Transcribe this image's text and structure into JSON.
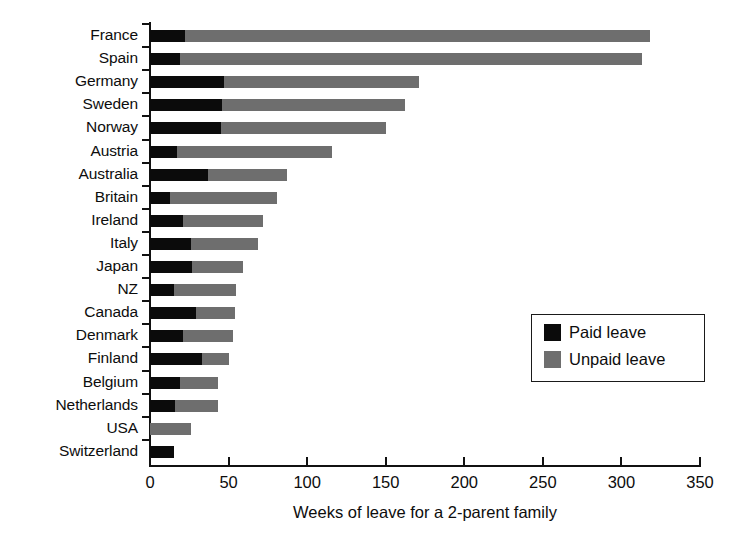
{
  "chart_data": {
    "type": "bar",
    "orientation": "horizontal",
    "stacked": true,
    "title": "",
    "xlabel": "Weeks of leave for a 2-parent family",
    "ylabel": "",
    "xlim": [
      0,
      350
    ],
    "xticks": [
      0,
      50,
      100,
      150,
      200,
      250,
      300,
      350
    ],
    "xtick_labels": [
      "0",
      "50",
      "100",
      "150",
      "200",
      "250",
      "300",
      "350"
    ],
    "grid": false,
    "legend_position": "center-right",
    "categories": [
      "France",
      "Spain",
      "Germany",
      "Sweden",
      "Norway",
      "Austria",
      "Australia",
      "Britain",
      "Ireland",
      "Italy",
      "Japan",
      "NZ",
      "Canada",
      "Denmark",
      "Finland",
      "Belgium",
      "Netherlands",
      "USA",
      "Switzerland"
    ],
    "series": [
      {
        "name": "Paid leave",
        "color": "#0b0b0b",
        "values": [
          22,
          19,
          47,
          46,
          45,
          17,
          37,
          13,
          21,
          26,
          27,
          15,
          29,
          21,
          33,
          19,
          16,
          0,
          15
        ]
      },
      {
        "name": "Unpaid leave",
        "color": "#6e6e6e",
        "values": [
          296,
          294,
          124,
          116,
          105,
          99,
          50,
          68,
          51,
          43,
          32,
          40,
          25,
          32,
          17,
          24,
          27,
          26,
          0
        ]
      }
    ],
    "totals": [
      318,
      313,
      171,
      162,
      150,
      116,
      87,
      81,
      72,
      69,
      59,
      55,
      54,
      53,
      50,
      43,
      43,
      26,
      15
    ],
    "annotations": []
  },
  "legend": {
    "entries": [
      {
        "label": "Paid leave",
        "swatch": "black-square"
      },
      {
        "label": "Unpaid leave",
        "swatch": "gray-square"
      }
    ]
  },
  "colors": {
    "paid": "#0b0b0b",
    "unpaid": "#6e6e6e",
    "axis": "#111111",
    "background": "#ffffff"
  }
}
